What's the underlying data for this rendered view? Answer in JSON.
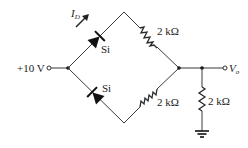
{
  "diagram": {
    "type": "diode-resistor bridge circuit",
    "source": {
      "label": "+10 V"
    },
    "output": {
      "label_main": "V",
      "label_sub": "o"
    },
    "current": {
      "label_main": "I",
      "label_sub": "D"
    },
    "diodes": [
      {
        "id": "D1",
        "label": "Si",
        "branch": "upper-left"
      },
      {
        "id": "D2",
        "label": "Si",
        "branch": "lower-left"
      }
    ],
    "resistors": [
      {
        "id": "R1",
        "label": "2 kΩ",
        "branch": "upper-right"
      },
      {
        "id": "R2",
        "label": "2 kΩ",
        "branch": "lower-right"
      },
      {
        "id": "R3",
        "label": "2 kΩ",
        "branch": "output-to-ground"
      }
    ],
    "ground": {
      "symbol": "ground"
    },
    "colors": {
      "line": "#3a3a3a",
      "component": "#111111",
      "background": "#ffffff"
    }
  }
}
